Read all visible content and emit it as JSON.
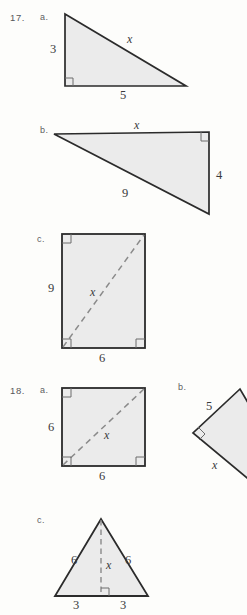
{
  "page": {
    "background_color": "#fdfdfb",
    "shape_fill": "#ebebeb",
    "stroke_color": "#2b2b2b",
    "dash_color": "#8a8a8a"
  },
  "problems": [
    {
      "number": "17.",
      "parts": [
        {
          "key": "a.",
          "shape": "right-triangle",
          "labels": {
            "leg_vertical": "3",
            "leg_horizontal": "5",
            "hypotenuse": "x"
          }
        },
        {
          "key": "b.",
          "shape": "right-triangle",
          "labels": {
            "top": "x",
            "right": "4",
            "hypotenuse": "9"
          }
        },
        {
          "key": "c.",
          "shape": "rectangle-with-diagonal",
          "labels": {
            "height": "9",
            "width": "6",
            "diagonal": "x"
          }
        }
      ]
    },
    {
      "number": "18.",
      "parts": [
        {
          "key": "a.",
          "shape": "square-with-diagonal",
          "labels": {
            "height": "6",
            "width": "6",
            "diagonal": "x"
          }
        },
        {
          "key": "b.",
          "shape": "right-triangle-rotated",
          "labels": {
            "upper_leg": "5",
            "lower_leg": "x"
          }
        },
        {
          "key": "c.",
          "shape": "isosceles-triangle-with-altitude",
          "labels": {
            "left_side": "6",
            "right_side": "6",
            "altitude": "x",
            "base_left": "3",
            "base_right": "3"
          }
        }
      ]
    }
  ],
  "text": {
    "n17": "17.",
    "n18": "18.",
    "a": "a.",
    "b": "b.",
    "c": "c.",
    "p17a_leg_v": "3",
    "p17a_leg_h": "5",
    "p17a_hyp": "x",
    "p17b_top": "x",
    "p17b_right": "4",
    "p17b_hyp": "9",
    "p17c_height": "9",
    "p17c_width": "6",
    "p17c_diag": "x",
    "p18a_height": "6",
    "p18a_width": "6",
    "p18a_diag": "x",
    "p18b_upper": "5",
    "p18b_lower": "x",
    "p18c_left": "6",
    "p18c_right": "6",
    "p18c_alt": "x",
    "p18c_base_left": "3",
    "p18c_base_right": "3"
  }
}
